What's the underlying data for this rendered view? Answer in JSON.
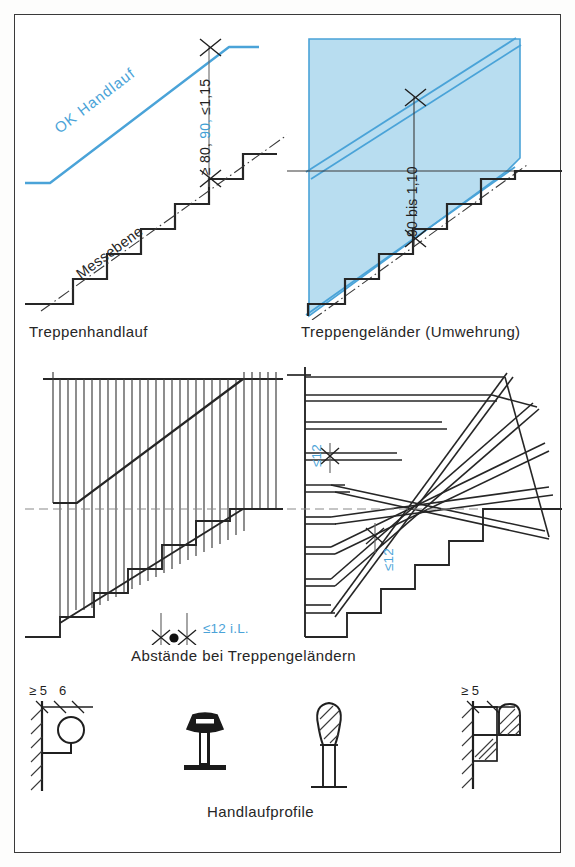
{
  "figure": {
    "title_visible": false,
    "colors": {
      "accent_blue": "#4aa3d8",
      "fill_blue": "#b8ddf0",
      "line_dark": "#262626",
      "frame": "#3a3a3a"
    }
  },
  "panels": {
    "top_left": {
      "caption": "Treppenhandlauf",
      "handrail_label": "OK Handlauf",
      "measuring_plane_label": "Messebene",
      "dimension": {
        "prefix": "≥ 80,",
        "highlight": "90,",
        "suffix": "≤1,15"
      },
      "step_count": 5
    },
    "top_right": {
      "caption": "Treppengeländer (Umwehrung)",
      "dimension": "90 bis 1,10",
      "step_count": 5
    },
    "bottom_left": {
      "gap_label": "≤12 i.L.",
      "baluster_count": 26
    },
    "bottom_right": {
      "gap_label_upper": "≤12",
      "gap_label_lower": "≤12",
      "rail_count": 7
    },
    "bottom_caption": "Abstände bei Treppengeländern"
  },
  "profiles": {
    "caption": "Handlaufprofile",
    "left_detail": {
      "dim_a": "≥ 5",
      "dim_b": "6"
    },
    "right_detail": {
      "dim_a": "≥ 5"
    },
    "items": [
      {
        "name": "wall-mounted-round-handrail"
      },
      {
        "name": "flared-top-handrail-profile"
      },
      {
        "name": "oval-knob-handrail-profile"
      },
      {
        "name": "wall-bracket-handrail-profile"
      }
    ]
  }
}
